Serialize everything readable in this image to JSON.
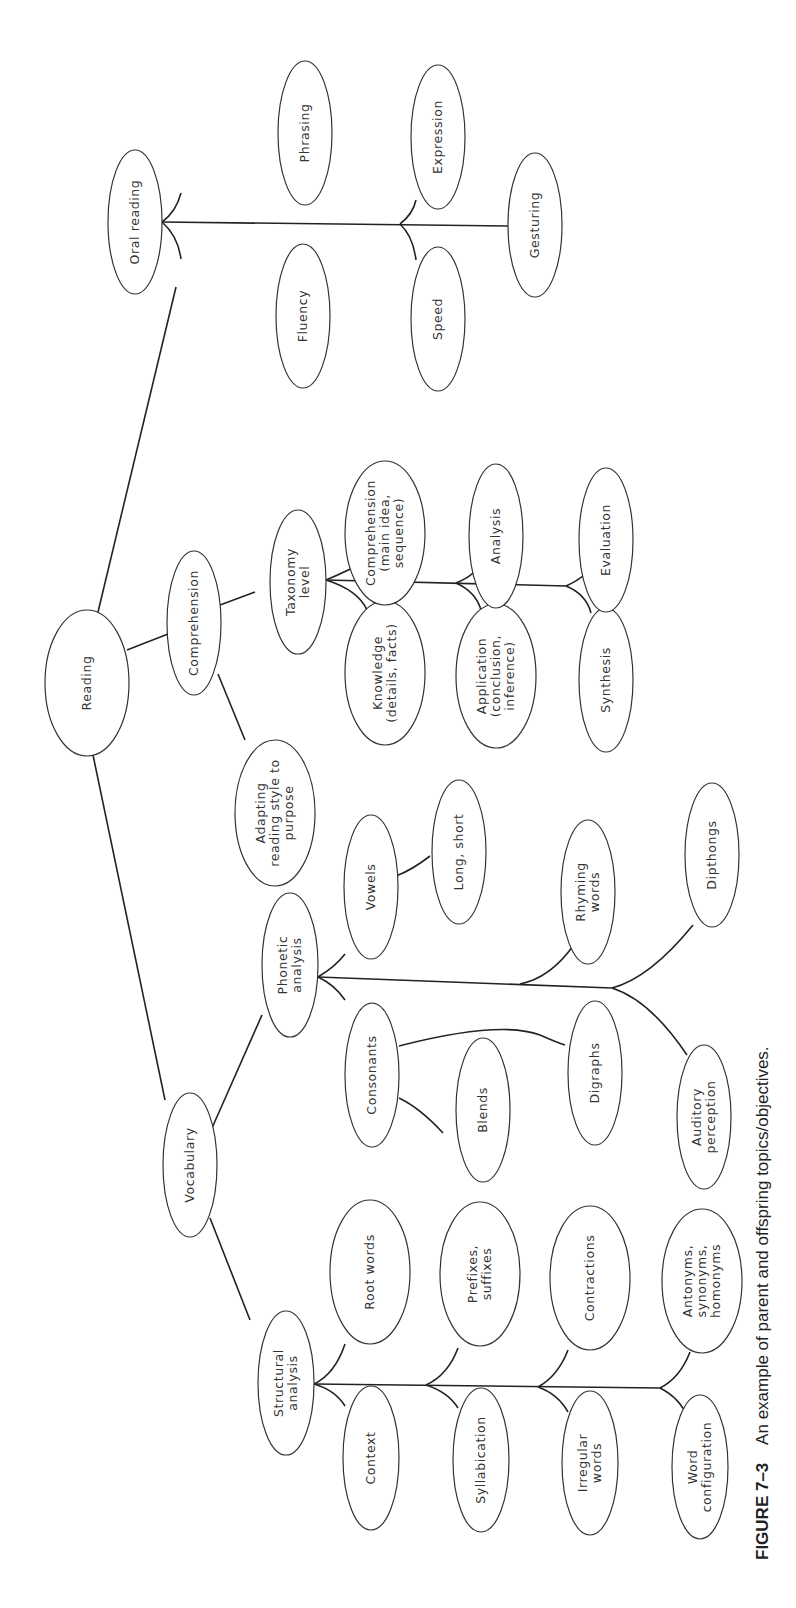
{
  "figure": {
    "label": "FIGURE 7–3",
    "caption": "An example of parent and offspring topics/objectives.",
    "orientation": "rotated 90° counter-clockwise"
  },
  "tree": {
    "label": "Reading",
    "children": [
      {
        "label": "Vocabulary",
        "children": [
          {
            "label": "Structural analysis",
            "children": [
              {
                "label": "Context"
              },
              {
                "label": "Root words"
              },
              {
                "label": "Syllabication"
              },
              {
                "label": "Prefixes, suffixes"
              },
              {
                "label": "Irregular words"
              },
              {
                "label": "Contractions"
              },
              {
                "label": "Word configuration"
              },
              {
                "label": "Antonyms, synonyms, homonyms"
              }
            ]
          },
          {
            "label": "Phonetic analysis",
            "children": [
              {
                "label": "Consonants",
                "children": [
                  {
                    "label": "Blends"
                  },
                  {
                    "label": "Digraphs"
                  }
                ]
              },
              {
                "label": "Vowels",
                "children": [
                  {
                    "label": "Long, short"
                  }
                ]
              },
              {
                "label": "Auditory perception"
              },
              {
                "label": "Rhyming words"
              },
              {
                "label": "Dipthongs"
              }
            ]
          }
        ]
      },
      {
        "label": "Comprehension",
        "children": [
          {
            "label": "Adapting reading style to purpose"
          },
          {
            "label": "Taxonomy level",
            "children": [
              {
                "label": "Knowledge (details, facts)"
              },
              {
                "label": "Comprehension (main idea, sequence)"
              },
              {
                "label": "Application (conclusion, inference)"
              },
              {
                "label": "Analysis"
              },
              {
                "label": "Synthesis"
              },
              {
                "label": "Evaluation"
              }
            ]
          }
        ]
      },
      {
        "label": "Oral reading",
        "children": [
          {
            "label": "Fluency"
          },
          {
            "label": "Phrasing"
          },
          {
            "label": "Speed"
          },
          {
            "label": "Expression"
          },
          {
            "label": "Gesturing"
          }
        ]
      }
    ]
  },
  "nodes": {
    "reading": {
      "lines": [
        "Reading"
      ]
    },
    "vocabulary": {
      "lines": [
        "Vocabulary"
      ]
    },
    "comprehension": {
      "lines": [
        "Comprehension"
      ]
    },
    "oral_reading": {
      "lines": [
        "Oral reading"
      ]
    },
    "structural_analysis": {
      "lines": [
        "Structural",
        "analysis"
      ]
    },
    "phonetic_analysis": {
      "lines": [
        "Phonetic",
        "analysis"
      ]
    },
    "taxonomy_level": {
      "lines": [
        "Taxonomy",
        "level"
      ]
    },
    "adapting": {
      "lines": [
        "Adapting",
        "reading style to",
        "purpose"
      ]
    },
    "context": {
      "lines": [
        "Context"
      ]
    },
    "root_words": {
      "lines": [
        "Root words"
      ]
    },
    "syllabication": {
      "lines": [
        "Syllabication"
      ]
    },
    "prefixes": {
      "lines": [
        "Prefixes,",
        "suffixes"
      ]
    },
    "irregular": {
      "lines": [
        "Irregular",
        "words"
      ]
    },
    "contractions": {
      "lines": [
        "Contractions"
      ]
    },
    "word_config": {
      "lines": [
        "Word",
        "configuration"
      ]
    },
    "antonyms": {
      "lines": [
        "Antonyms,",
        "synonyms,",
        "homonyms"
      ]
    },
    "consonants": {
      "lines": [
        "Consonants"
      ]
    },
    "blends": {
      "lines": [
        "Blends"
      ]
    },
    "digraphs": {
      "lines": [
        "Digraphs"
      ]
    },
    "auditory": {
      "lines": [
        "Auditory",
        "perception"
      ]
    },
    "vowels": {
      "lines": [
        "Vowels"
      ]
    },
    "long_short": {
      "lines": [
        "Long, short"
      ]
    },
    "rhyming": {
      "lines": [
        "Rhyming",
        "words"
      ]
    },
    "dipthongs": {
      "lines": [
        "Dipthongs"
      ]
    },
    "knowledge": {
      "lines": [
        "Knowledge",
        "(details, facts)"
      ]
    },
    "comp_main": {
      "lines": [
        "Comprehension",
        "(main idea,",
        "sequence)"
      ]
    },
    "application": {
      "lines": [
        "Application",
        "(conclusion,",
        "inference)"
      ]
    },
    "analysis": {
      "lines": [
        "Analysis"
      ]
    },
    "synthesis": {
      "lines": [
        "Synthesis"
      ]
    },
    "evaluation": {
      "lines": [
        "Evaluation"
      ]
    },
    "fluency": {
      "lines": [
        "Fluency"
      ]
    },
    "phrasing": {
      "lines": [
        "Phrasing"
      ]
    },
    "speed": {
      "lines": [
        "Speed"
      ]
    },
    "expression": {
      "lines": [
        "Expression"
      ]
    },
    "gesturing": {
      "lines": [
        "Gesturing"
      ]
    }
  },
  "colors": {
    "stroke": "#333333",
    "background": "#ffffff"
  }
}
